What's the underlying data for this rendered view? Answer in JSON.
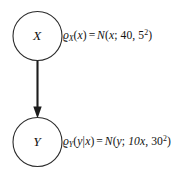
{
  "diagram": {
    "type": "bayesian-network",
    "background_color": "#ffffff",
    "stroke_color": "#2b2b2b",
    "edge_color": "#1c1c1c",
    "text_color": "#111111",
    "nodes": [
      {
        "id": "x",
        "label": "X",
        "cx": 37.5,
        "cy": 36,
        "r": 24.5
      },
      {
        "id": "y",
        "label": "Y",
        "cx": 37.5,
        "cy": 142,
        "r": 24.5
      }
    ],
    "edges": [
      {
        "id": "x-to-y",
        "from": "X",
        "to": "Y",
        "direction": "down",
        "arrowhead": "solid-triangle"
      }
    ]
  },
  "formulas": {
    "prior": {
      "id": "formula-x",
      "density_symbol": "ϱ",
      "density_subscript": "X",
      "argument_open": "(",
      "argument": "x",
      "argument_close": ")",
      "equals": "=",
      "distribution": "N",
      "dist_open": "(",
      "variable": "x",
      "semicolon": ";",
      "mean": "40",
      "comma": ",",
      "variance_base": "5",
      "variance_exponent": "2",
      "dist_close": ")",
      "plain_text": "ϱ_X(x) = N(x; 40, 5²)"
    },
    "conditional": {
      "id": "formula-y",
      "density_symbol": "ϱ",
      "density_subscript": "Y",
      "argument_open": "(",
      "argument": "y",
      "given_bar": "|",
      "given": "x",
      "argument_close": ")",
      "equals": "=",
      "distribution": "N",
      "dist_open": "(",
      "variable": "y",
      "semicolon": ";",
      "mean": "10x",
      "comma": ",",
      "variance_base": "30",
      "variance_exponent": "2",
      "dist_close": ")",
      "plain_text": "ϱ_Y(y|x) = N(y; 10x, 30²)"
    }
  }
}
